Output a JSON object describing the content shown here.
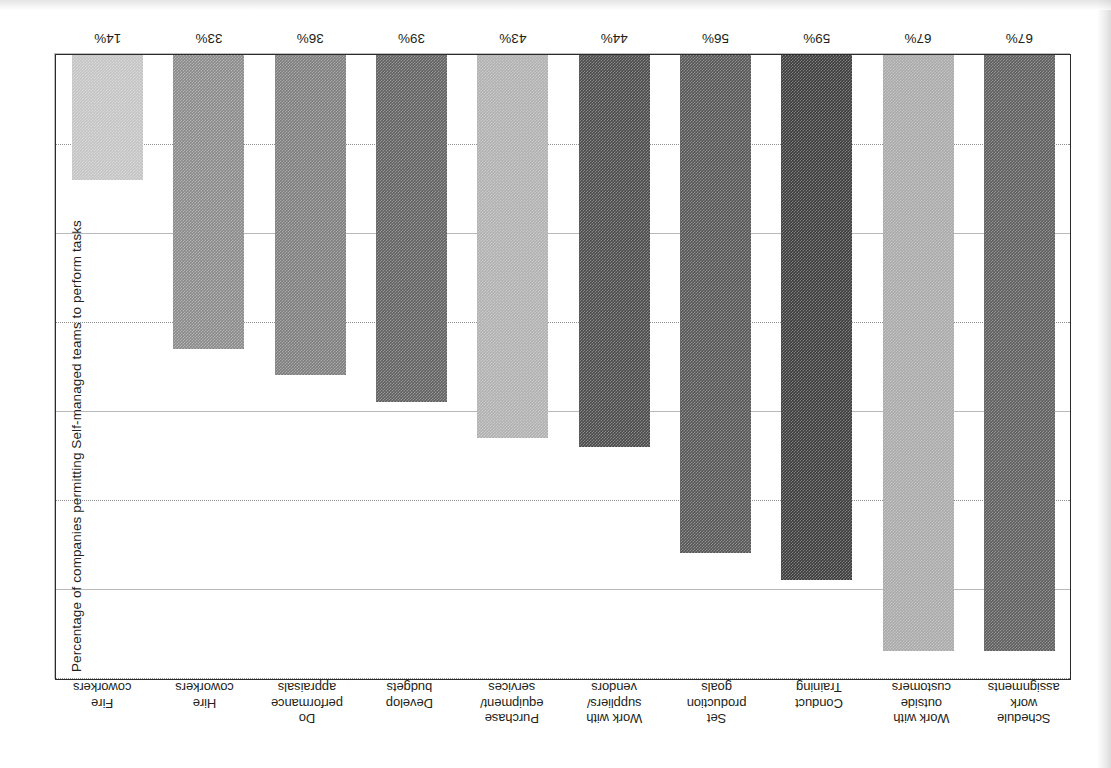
{
  "axis": {
    "title": "Percentage of companies permitting Self-managed teams to perform tasks"
  },
  "chart_data": {
    "type": "bar",
    "title": "",
    "subtitle": "",
    "xlabel": "",
    "ylabel": "Percentage of companies permitting Self-managed teams to perform tasks",
    "ylim": [
      0,
      70
    ],
    "grid": true,
    "legend": "none",
    "orientation": "vertical",
    "note": "Figure appears rotated 180 degrees in the source scan",
    "categories": [
      "Schedule work assignments",
      "Work with outside customers",
      "Conduct Training",
      "Set production goals",
      "Work with suppliers/ vendors",
      "Purchase equipment/ services",
      "Develop budgets",
      "Do performance appraisals",
      "Hire coworkers",
      "Fire coworkers"
    ],
    "values": [
      67,
      67,
      59,
      56,
      44,
      43,
      39,
      36,
      33,
      14
    ],
    "value_labels": [
      "67%",
      "67%",
      "59%",
      "56%",
      "44%",
      "43%",
      "39%",
      "36%",
      "33%",
      "14%"
    ],
    "bar_colors": [
      "#5d5d5d",
      "#a9a9a9",
      "#3b3b3b",
      "#555555",
      "#4a4a4a",
      "#b0b0b0",
      "#606060",
      "#7d7d7d",
      "#8a8a8a",
      "#c4c4c4"
    ],
    "gridline_values": [
      10,
      20,
      30,
      40,
      50,
      60,
      70
    ]
  },
  "categories_wrapped": [
    [
      "Schedule",
      "work",
      "assignments"
    ],
    [
      "Work with",
      "outside",
      "customers"
    ],
    [
      "Conduct",
      "Training"
    ],
    [
      "Set",
      "production",
      "goals"
    ],
    [
      "Work with",
      "suppliers/",
      "vendors"
    ],
    [
      "Purchase",
      "equipment/",
      "services"
    ],
    [
      "Develop",
      "budgets"
    ],
    [
      "Do",
      "performance",
      "appraisals"
    ],
    [
      "Hire",
      "coworkers"
    ],
    [
      "Fire",
      "coworkers"
    ]
  ]
}
